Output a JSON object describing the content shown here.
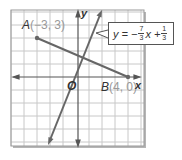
{
  "diagram": {
    "type": "coordinate-plane",
    "colors": {
      "grid": "#c8c8c8",
      "axis": "#555555",
      "line": "#666666",
      "frame_shadow": "#b5b5b5",
      "point": "#666666"
    },
    "axes": {
      "x_label": "x",
      "y_label": "y",
      "origin_label": "O"
    },
    "points": [
      {
        "name": "A",
        "label_prefix": "A",
        "coords_text": "(−3, 3)",
        "x": -3,
        "y": 3
      },
      {
        "name": "B",
        "label_prefix": "B",
        "coords_text": "(4, 0)",
        "x": 4,
        "y": 0
      }
    ],
    "lines": [
      {
        "name": "segment-AB",
        "from": [
          -3,
          3
        ],
        "to": [
          4,
          0
        ]
      },
      {
        "name": "steep-line",
        "passes_near": [
          0,
          0
        ],
        "arrows": "both"
      }
    ],
    "callout": {
      "lhs": "y = −",
      "frac1_num": "7",
      "frac1_den": "3",
      "mid": "x +",
      "frac2_num": "1",
      "frac2_den": "3"
    }
  }
}
